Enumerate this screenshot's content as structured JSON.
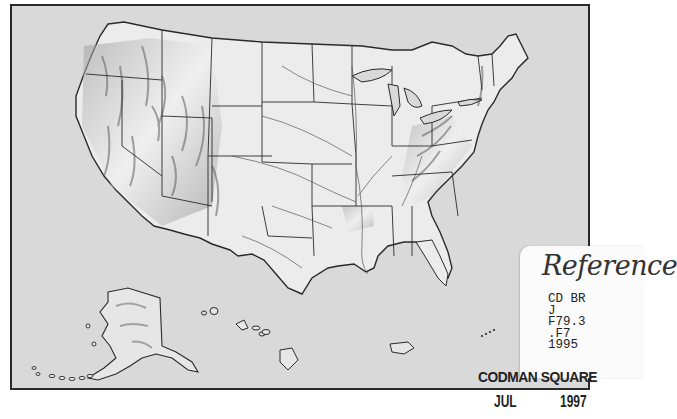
{
  "map": {
    "title": "United States relief map",
    "regions": [
      "Contiguous United States",
      "Alaska",
      "Hawaii",
      "Puerto Rico"
    ],
    "colors": {
      "background": "#d9d9d9",
      "land": "#ececec",
      "relief_shading": "#6a6a6a",
      "border": "#2a2a2a",
      "river": "#555555"
    }
  },
  "library_label": {
    "heading": "Reference",
    "call_number_lines": [
      "CD BR",
      "J",
      "F79.3",
      ".F7",
      "1995"
    ]
  },
  "stamp": {
    "branch": "CODMAN SQUARE",
    "month": "JUL",
    "year": "1997"
  }
}
